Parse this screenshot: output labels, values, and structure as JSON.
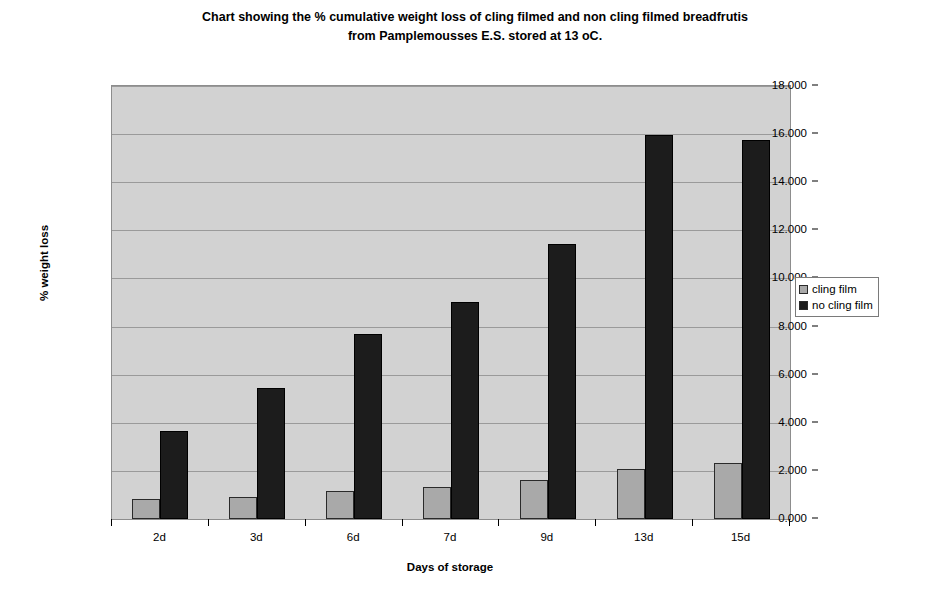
{
  "chart_data": {
    "type": "bar",
    "title": "Chart showing the % cumulative weight loss of cling filmed and non cling filmed breadfrutis from Pamplemousses E.S. stored at 13 oC.",
    "title_line1": "Chart showing the % cumulative weight loss of cling filmed and non cling filmed breadfrutis",
    "title_line2": "from Pamplemousses E.S. stored at 13 oC.",
    "xlabel": "Days of storage",
    "ylabel": "% weight loss",
    "categories": [
      "2d",
      "3d",
      "6d",
      "7d",
      "9d",
      "13d",
      "15d"
    ],
    "series": [
      {
        "name": "cling film",
        "color": "#a9a9a9",
        "values": [
          0.83,
          0.92,
          1.17,
          1.33,
          1.62,
          2.06,
          2.31
        ]
      },
      {
        "name": "no cling film",
        "color": "#1c1c1c",
        "values": [
          3.66,
          5.44,
          7.69,
          9.02,
          11.42,
          15.97,
          15.77
        ]
      }
    ],
    "ylim": [
      0,
      18
    ],
    "ytick_step": 2,
    "yticks": [
      "0.000",
      "2.000",
      "4.000",
      "6.000",
      "8.000",
      "10.000",
      "12.000",
      "14.000",
      "16.000",
      "18.000"
    ],
    "grid": true,
    "legend_position": "right",
    "plot_background": "#d2d2d2"
  }
}
